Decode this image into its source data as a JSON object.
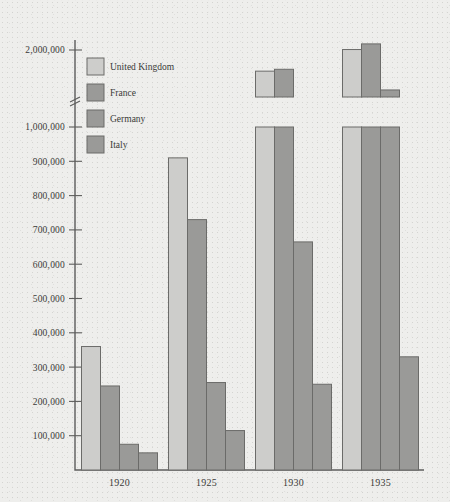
{
  "chart_data": {
    "type": "bar",
    "title": "",
    "subtitle": "",
    "xlabel": "",
    "ylabel": "",
    "categories": [
      "1920",
      "1925",
      "1930",
      "1935"
    ],
    "series": [
      {
        "name": "United Kingdom",
        "color": "#cdcdcb",
        "values": [
          360000,
          910000,
          1550000,
          2010000
        ]
      },
      {
        "name": "France",
        "color": "#9a9a98",
        "values": [
          245000,
          730000,
          1590000,
          2130000
        ]
      },
      {
        "name": "Germany",
        "color": "#9a9a98",
        "values": [
          75000,
          255000,
          665000,
          1150000
        ]
      },
      {
        "name": "Italy",
        "color": "#9a9a98",
        "values": [
          50000,
          115000,
          250000,
          330000
        ]
      }
    ],
    "ytick_labels": [
      "100,000",
      "200,000",
      "300,000",
      "400,000",
      "500,000",
      "600,000",
      "700,000",
      "800,000",
      "900,000",
      "1,000,000",
      "2,000,000"
    ],
    "ytick_values": [
      100000,
      200000,
      300000,
      400000,
      500000,
      600000,
      700000,
      800000,
      900000,
      1000000,
      2000000
    ],
    "axis_break": true,
    "axis_break_between": [
      1000000,
      2000000
    ],
    "ylim": [
      0,
      2200000
    ],
    "grid": false,
    "legend_position": "top-left",
    "legend_entries": [
      "United Kingdom",
      "France",
      "Germany",
      "Italy"
    ]
  },
  "colors": {
    "background": "#eeeeec",
    "axis": "#5d5d5c",
    "bar_light": "#cdcdcb",
    "bar_dark": "#9a9a98",
    "text": "#3a3a38"
  }
}
